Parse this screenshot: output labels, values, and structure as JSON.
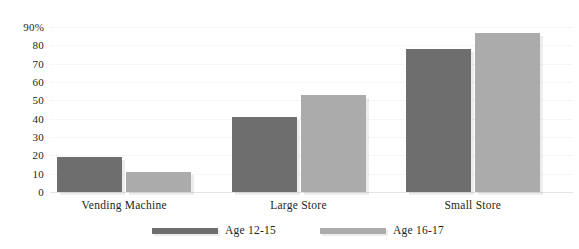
{
  "chart_data": {
    "type": "bar",
    "title": "",
    "subtitle": "",
    "xlabel": "",
    "ylabel": "",
    "categories": [
      "Vending Machine",
      "Large Store",
      "Small Store"
    ],
    "series": [
      {
        "name": "Age 12-15",
        "color": "#6e6e6e",
        "values": [
          19,
          41,
          78
        ]
      },
      {
        "name": "Age 16-17",
        "color": "#ababab",
        "values": [
          11,
          53,
          87
        ]
      }
    ],
    "ylim": [
      0,
      90
    ],
    "ytick_values": [
      90,
      80,
      70,
      60,
      50,
      40,
      30,
      20,
      10,
      0
    ],
    "ytick_labels": [
      "90%",
      "80",
      "70",
      "60",
      "50",
      "40",
      "30",
      "20",
      "10",
      "0"
    ],
    "ytick_step": 10,
    "grid": true,
    "grid_axis": "y",
    "grid_style": "dotted",
    "grid_color": "#eeeeee",
    "legend_position": "bottom",
    "legend_entries": [
      "Age 12-15",
      "Age 16-17"
    ],
    "background_color": "#ffffff",
    "text_color": "#231f20"
  }
}
